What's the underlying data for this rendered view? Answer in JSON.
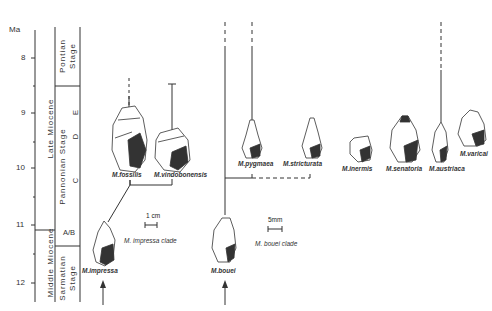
{
  "timescale": {
    "unit_label": "Ma",
    "ticks": [
      {
        "value": "8",
        "y": 58
      },
      {
        "value": "9",
        "y": 113
      },
      {
        "value": "10",
        "y": 168
      },
      {
        "value": "11",
        "y": 225
      },
      {
        "value": "12",
        "y": 283
      }
    ],
    "epochs": [
      {
        "label": "Late   Miocene"
      },
      {
        "label": "Middle Miocene"
      }
    ],
    "stages": [
      {
        "label_line1": "Pontian",
        "label_line2": "Stage"
      },
      {
        "label": "Pannonian Stage"
      },
      {
        "label_line1": "Sarmatian",
        "label_line2": "Stage"
      }
    ],
    "substages": [
      "E",
      "D",
      "C",
      "A/B"
    ]
  },
  "species": [
    {
      "name": "M.fossilis"
    },
    {
      "name": "M.vindobonensis"
    },
    {
      "name": "M.impressa"
    },
    {
      "name": "M.bouei"
    },
    {
      "name": "M.pygmaea"
    },
    {
      "name": "M.stricturata"
    },
    {
      "name": "M.inermis"
    },
    {
      "name": "M.senatoria"
    },
    {
      "name": "M.austriaca"
    },
    {
      "name": "M.varicai"
    }
  ],
  "clades": {
    "impressa": "M. impressa clade",
    "bouei": "M. bouei clade"
  },
  "scale_bars": {
    "impressa": "1 cm",
    "bouei": "5mm"
  }
}
